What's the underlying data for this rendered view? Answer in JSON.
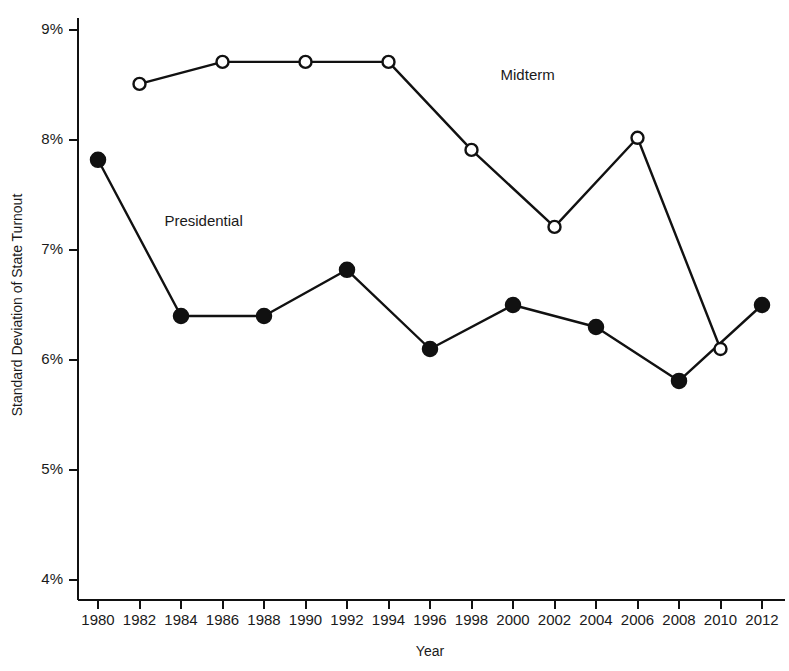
{
  "chart_data": {
    "type": "line",
    "title": "",
    "xlabel": "Year",
    "ylabel": "Standard Deviation of State Turnout",
    "x": [
      1980,
      1982,
      1984,
      1986,
      1988,
      1990,
      1992,
      1994,
      1996,
      1998,
      2000,
      2002,
      2004,
      2006,
      2008,
      2010,
      2012
    ],
    "xlim": [
      1979,
      2013
    ],
    "ylim": [
      3.8,
      9.2
    ],
    "grid": false,
    "legend_position": "inline-annotation",
    "x_tick_labels": [
      "1980",
      "1982",
      "1984",
      "1986",
      "1988",
      "1990",
      "1992",
      "1994",
      "1996",
      "1998",
      "2000",
      "2002",
      "2004",
      "2006",
      "2008",
      "2010",
      "2012"
    ],
    "y_tick_values": [
      4,
      5,
      6,
      7,
      8,
      9
    ],
    "y_tick_labels": [
      "4%",
      "5%",
      "6%",
      "7%",
      "8%",
      "9%"
    ],
    "series": [
      {
        "name": "Presidential",
        "marker": "filled-circle",
        "annotation": "Presidential",
        "annotation_x": 1983.2,
        "annotation_y": 7.22,
        "points": [
          {
            "x": 1980,
            "y": 7.82
          },
          {
            "x": 1984,
            "y": 6.4
          },
          {
            "x": 1988,
            "y": 6.4
          },
          {
            "x": 1992,
            "y": 6.82
          },
          {
            "x": 1996,
            "y": 6.1
          },
          {
            "x": 2000,
            "y": 6.5
          },
          {
            "x": 2004,
            "y": 6.3
          },
          {
            "x": 2008,
            "y": 5.81
          },
          {
            "x": 2012,
            "y": 6.5
          }
        ]
      },
      {
        "name": "Midterm",
        "marker": "open-circle",
        "annotation": "Midterm",
        "annotation_x": 1999.4,
        "annotation_y": 8.55,
        "points": [
          {
            "x": 1982,
            "y": 8.51
          },
          {
            "x": 1986,
            "y": 8.71
          },
          {
            "x": 1990,
            "y": 8.71
          },
          {
            "x": 1994,
            "y": 8.71
          },
          {
            "x": 1998,
            "y": 7.91
          },
          {
            "x": 2002,
            "y": 7.21
          },
          {
            "x": 2006,
            "y": 8.02
          },
          {
            "x": 2010,
            "y": 6.1
          }
        ]
      }
    ]
  },
  "figure": {
    "background_color": "#ffffff",
    "foreground_color": "#111111"
  }
}
